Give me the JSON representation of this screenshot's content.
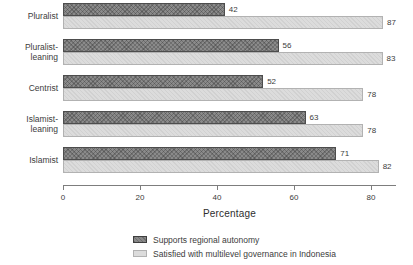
{
  "chart_data": {
    "type": "bar",
    "orientation": "horizontal",
    "title": "",
    "xlabel": "Percentage",
    "ylabel": "",
    "xlim": [
      0,
      86.5
    ],
    "xticks": [
      0,
      20,
      40,
      60,
      80
    ],
    "grid": false,
    "legend_position": "bottom",
    "categories": [
      "Pluralist",
      "Pluralist-leaning",
      "Centrist",
      "Islamist-leaning",
      "Islamist"
    ],
    "series": [
      {
        "name": "Supports regional autonomy",
        "color": "#8a8a8a",
        "pattern": "crosshatch",
        "values": [
          42,
          56,
          52,
          63,
          71
        ]
      },
      {
        "name": "Satisfied with multilevel governance in Indonesia",
        "color": "#dcdcdc",
        "pattern": "dotted",
        "values": [
          87,
          83,
          78,
          78,
          82
        ]
      }
    ]
  },
  "legend": {
    "items": [
      {
        "label": "Supports regional autonomy",
        "color": "#8a8a8a"
      },
      {
        "label": "Satisfied with multilevel governance in Indonesia",
        "color": "#dcdcdc"
      }
    ]
  },
  "colors": {
    "dark_bar": "#8a8a8a",
    "dark_bar_border": "#4d4d4d",
    "light_bar": "#dcdcdc",
    "light_bar_border": "#b2b2b2",
    "axis": "#7d7d7d",
    "text": "#3c3c3c",
    "background": "#ffffff"
  }
}
